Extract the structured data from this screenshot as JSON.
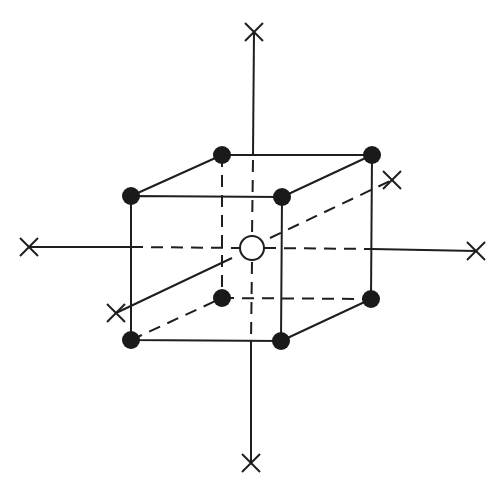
{
  "diagram": {
    "type": "cubic-lattice-with-axes",
    "colors": {
      "line": "#1e1e1e",
      "node": "#1a1a1a",
      "background": "#ffffff"
    },
    "axes": {
      "vertical": {
        "from": [
          254,
          32
        ],
        "to": [
          251,
          463
        ]
      },
      "horizontal": {
        "from": [
          29,
          247
        ],
        "to": [
          476,
          251
        ]
      },
      "depth": {
        "from": [
          116,
          313
        ],
        "to": [
          392,
          180
        ]
      }
    },
    "cube": {
      "front": {
        "tl": [
          131,
          196
        ],
        "tr": [
          282,
          197
        ],
        "br": [
          281,
          341
        ],
        "bl": [
          131,
          340
        ]
      },
      "back": {
        "tl": [
          222,
          155
        ],
        "tr": [
          372,
          155
        ],
        "br": [
          371,
          299
        ],
        "bl": [
          222,
          298
        ]
      }
    },
    "center_site": {
      "cx": 252,
      "cy": 248,
      "r": 12,
      "style": "hollow"
    },
    "corner_sites": 8,
    "axis_end_markers": "x-cross"
  }
}
